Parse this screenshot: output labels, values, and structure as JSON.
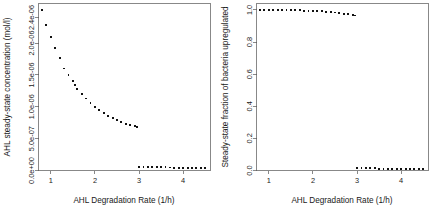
{
  "figure": {
    "background": "#ffffff",
    "point_color": "#111111",
    "axis_color": "#555555",
    "panel_count": 2
  },
  "chart_data": [
    {
      "type": "scatter",
      "panel": "left",
      "title": "",
      "xlabel": "AHL Degradation Rate (1/h)",
      "ylabel": "AHL steady-state concentration (mol/l)",
      "xlim": [
        0.72,
        4.62
      ],
      "ylim": [
        0.0,
        2.62e-06
      ],
      "xticks": [
        1,
        2,
        3,
        4
      ],
      "xtick_labels": [
        "1",
        "2",
        "3",
        "4"
      ],
      "yticks": [
        0.0,
        5e-07,
        1e-06,
        1.5e-06,
        2e-06,
        2.4e-06
      ],
      "ytick_labels": [
        "0.0e+00",
        "5.0e-07",
        "1.0e-06",
        "1.5e-06",
        "2.0e-06",
        "2.4e-06"
      ],
      "grid": false,
      "legend": null,
      "marker": "filled-square",
      "series": [
        {
          "name": "upper-branch",
          "x": [
            0.8,
            0.9,
            1.0,
            1.1,
            1.2,
            1.3,
            1.4,
            1.5,
            1.55,
            1.6,
            1.7,
            1.8,
            1.9,
            2.0,
            2.1,
            2.2,
            2.3,
            2.4,
            2.5,
            2.6,
            2.7,
            2.8,
            2.9,
            2.95
          ],
          "y": [
            2.52e-06,
            2.28e-06,
            2.1e-06,
            1.92e-06,
            1.76e-06,
            1.6e-06,
            1.5e-06,
            1.4e-06,
            1.34e-06,
            1.28e-06,
            1.2e-06,
            1.13e-06,
            1.06e-06,
            1e-06,
            9.5e-07,
            9e-07,
            8.6e-07,
            8.2e-07,
            7.9e-07,
            7.6e-07,
            7.35e-07,
            7.12e-07,
            6.95e-07,
            6.85e-07
          ]
        },
        {
          "name": "lower-branch",
          "x": [
            3.0,
            3.1,
            3.2,
            3.3,
            3.4,
            3.5,
            3.6,
            3.7,
            3.8,
            3.9,
            4.0,
            4.1,
            4.2,
            4.3,
            4.4,
            4.5
          ],
          "y": [
            5.5e-08,
            5.3e-08,
            5.2e-08,
            5.1e-08,
            5e-08,
            4.9e-08,
            4.8e-08,
            4.7e-08,
            4.6e-08,
            4.5e-08,
            4.4e-08,
            4.3e-08,
            4.3e-08,
            4.2e-08,
            4.2e-08,
            4.1e-08
          ]
        }
      ]
    },
    {
      "type": "scatter",
      "panel": "right",
      "title": "",
      "xlabel": "AHL Degradation Rate (1/h)",
      "ylabel": "Steady-state fraction of bacteria upregulated",
      "xlim": [
        0.72,
        4.62
      ],
      "ylim": [
        0.0,
        1.04
      ],
      "xticks": [
        1,
        2,
        3,
        4
      ],
      "xtick_labels": [
        "1",
        "2",
        "3",
        "4"
      ],
      "yticks": [
        0.0,
        0.2,
        0.4,
        0.6,
        0.8,
        1.0
      ],
      "ytick_labels": [
        "0.0",
        "0.2",
        "0.4",
        "0.6",
        "0.8",
        "1.0"
      ],
      "grid": false,
      "legend": null,
      "marker": "filled-square",
      "series": [
        {
          "name": "upper-branch",
          "x": [
            0.8,
            0.9,
            1.0,
            1.1,
            1.2,
            1.3,
            1.4,
            1.5,
            1.6,
            1.7,
            1.8,
            1.9,
            2.0,
            2.1,
            2.2,
            2.3,
            2.4,
            2.5,
            2.6,
            2.7,
            2.8,
            2.9,
            2.95
          ],
          "y": [
            1.0,
            1.0,
            1.0,
            1.0,
            0.999,
            0.999,
            0.999,
            0.998,
            0.998,
            0.997,
            0.996,
            0.995,
            0.994,
            0.993,
            0.991,
            0.989,
            0.987,
            0.984,
            0.981,
            0.977,
            0.973,
            0.968,
            0.965
          ]
        },
        {
          "name": "lower-branch",
          "x": [
            3.0,
            3.1,
            3.2,
            3.3,
            3.4,
            3.5,
            3.6,
            3.7,
            3.8,
            3.9,
            4.0,
            4.1,
            4.2,
            4.3,
            4.4,
            4.5
          ],
          "y": [
            0.018,
            0.016,
            0.015,
            0.014,
            0.013,
            0.012,
            0.012,
            0.011,
            0.011,
            0.01,
            0.01,
            0.009,
            0.009,
            0.009,
            0.008,
            0.008
          ]
        }
      ]
    }
  ]
}
